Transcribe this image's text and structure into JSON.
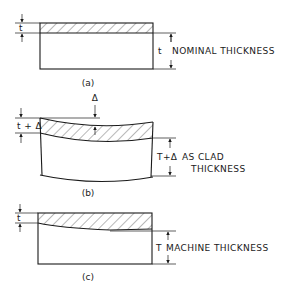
{
  "figure": {
    "panels": [
      {
        "id": "a",
        "caption": "(a)",
        "clad_dimension_label": "t",
        "base_dimension_label": "t",
        "description": "NOMINAL THICKNESS"
      },
      {
        "id": "b",
        "caption": "(b)",
        "deflection_label": "Δ",
        "clad_dimension_label": "t + Δ",
        "base_dimension_label": "T+Δ",
        "description_line1": "AS CLAD",
        "description_line2": "THICKNESS"
      },
      {
        "id": "c",
        "caption": "(c)",
        "clad_dimension_label": "t",
        "base_dimension_label": "T",
        "description": "MACHINE THICKNESS"
      }
    ]
  }
}
